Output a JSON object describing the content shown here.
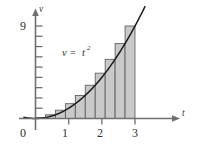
{
  "figure": {
    "name": "riemann-sum-velocity-figure",
    "background_color": "#ffffff"
  },
  "axes": {
    "x_axis_label": "t",
    "y_axis_label": "v",
    "origin_label": "0",
    "x_tick_labels": [
      "1",
      "2",
      "3"
    ],
    "y_tick_labels": [
      "9"
    ],
    "axis_color": "#6f6f6f"
  },
  "annotation": {
    "equation_variable": "v",
    "equation_equals": "=",
    "equation_base": "t",
    "equation_exponent": "2"
  },
  "colors": {
    "bar_fill": "#c9c9c9",
    "bar_stroke": "#555555",
    "curve_stroke": "#1c1c1c",
    "axis": "#6f6f6f",
    "text": "#2e2e2e"
  },
  "chart_data": {
    "type": "bar",
    "title": "",
    "subtitle": "",
    "xlabel": "t",
    "ylabel": "v",
    "xlim": [
      -0.35,
      3.95
    ],
    "ylim": [
      0,
      10.4
    ],
    "grid": false,
    "legend": null,
    "annotations": [
      {
        "text": "v = t^2",
        "x": 1.05,
        "y": 7.0
      }
    ],
    "x_ticks": [
      1,
      2,
      3
    ],
    "x_tick_labels": [
      "1",
      "2",
      "3"
    ],
    "y_ticks": [
      1,
      2,
      3,
      4,
      5,
      6,
      7,
      8,
      9
    ],
    "y_tick_labels_shown": {
      "9": "9"
    },
    "origin_label": "0",
    "function": {
      "expression": "v = t^2",
      "domain": [
        -0.35,
        3.3
      ],
      "points_x": [
        -0.35,
        0.0,
        0.3,
        0.6,
        0.9,
        1.2,
        1.5,
        1.8,
        2.1,
        2.4,
        2.7,
        3.0,
        3.15,
        3.3
      ],
      "points_y": [
        0.12,
        0.0,
        0.09,
        0.36,
        0.81,
        1.44,
        2.25,
        3.24,
        4.41,
        5.76,
        7.29,
        9.0,
        9.92,
        10.89
      ]
    },
    "riemann": {
      "method": "right-endpoint",
      "a": 0.0,
      "b": 3.0,
      "n": 10,
      "dx": 0.3,
      "categories": [
        "0.0-0.3",
        "0.3-0.6",
        "0.6-0.9",
        "0.9-1.2",
        "1.2-1.5",
        "1.5-1.8",
        "1.8-2.1",
        "2.1-2.4",
        "2.4-2.7",
        "2.7-3.0"
      ],
      "left_edges": [
        0.0,
        0.3,
        0.6,
        0.9,
        1.2,
        1.5,
        1.8,
        2.1,
        2.4,
        2.7
      ],
      "right_edges": [
        0.3,
        0.6,
        0.9,
        1.2,
        1.5,
        1.8,
        2.1,
        2.4,
        2.7,
        3.0
      ],
      "values": [
        0.09,
        0.36,
        0.81,
        1.44,
        2.25,
        3.24,
        4.41,
        5.76,
        7.29,
        9.0
      ]
    }
  }
}
